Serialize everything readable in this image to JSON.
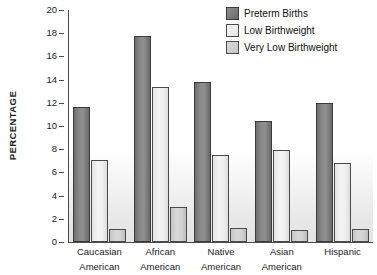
{
  "chart_data": {
    "type": "bar",
    "title": "",
    "xlabel": "",
    "ylabel": "PERCENTAGE",
    "ylim": [
      0,
      20
    ],
    "yticks": [
      20,
      18,
      16,
      14,
      12,
      10,
      8,
      6,
      4,
      2,
      0
    ],
    "grid": false,
    "legend_position": "top-right",
    "categories": [
      "Caucasian American",
      "African American",
      "Native American",
      "Asian American",
      "Hispanic"
    ],
    "category_lines": [
      [
        "Caucasian",
        "American"
      ],
      [
        "African",
        "American"
      ],
      [
        "Native",
        "American"
      ],
      [
        "Asian",
        "American"
      ],
      [
        "Hispanic",
        ""
      ]
    ],
    "series": [
      {
        "name": "Preterm Births",
        "color": "#7d7d7d",
        "values": [
          11.6,
          17.8,
          13.8,
          10.4,
          12.0
        ]
      },
      {
        "name": "Low Birthweight",
        "color": "#ededed",
        "values": [
          7.1,
          13.4,
          7.5,
          7.9,
          6.8
        ]
      },
      {
        "name": "Very Low Birthweight",
        "color": "#cfcfcf",
        "values": [
          1.1,
          3.0,
          1.2,
          1.0,
          1.1
        ]
      }
    ]
  },
  "axis": {
    "y_title": "PERCENTAGE"
  },
  "legend": {
    "items": [
      {
        "label": "Preterm Births",
        "swatch": "legend-swatch-preterm"
      },
      {
        "label": "Low Birthweight",
        "swatch": "legend-swatch-low"
      },
      {
        "label": "Very Low Birthweight",
        "swatch": "legend-swatch-very-low"
      }
    ]
  }
}
